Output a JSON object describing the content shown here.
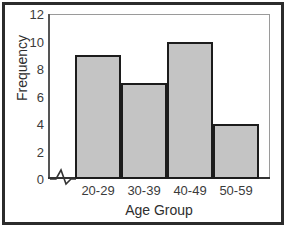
{
  "chart_data": {
    "type": "bar",
    "title": "",
    "subtitle": "",
    "xlabel": "Age Group",
    "ylabel": "Frequency",
    "categories": [
      "20-29",
      "30-39",
      "40-49",
      "50-59"
    ],
    "values": [
      9,
      7,
      10,
      4
    ],
    "series": [
      {
        "name": "Frequency",
        "values": [
          9,
          7,
          10,
          4
        ]
      }
    ],
    "ylim": [
      0,
      12
    ],
    "yticks": [
      0,
      2,
      4,
      6,
      8,
      10,
      12
    ],
    "ytick_labels": [
      "0",
      "2",
      "4",
      "6",
      "8",
      "10",
      "12"
    ],
    "grid": false,
    "legend": false,
    "legend_position": "none",
    "axis_break": true,
    "axis_break_symbol": "zigzag",
    "bar_gap": 0,
    "annotations": []
  },
  "style": {
    "bar_fill": "#c4c4c4",
    "bar_edge": "#1c1c1c",
    "plot_background": "#ffffff",
    "plot_border": "#9a9a9a",
    "frame_border": "#2b2b2b",
    "axis_color": "#555555",
    "text_color": "#3b3b3b"
  }
}
